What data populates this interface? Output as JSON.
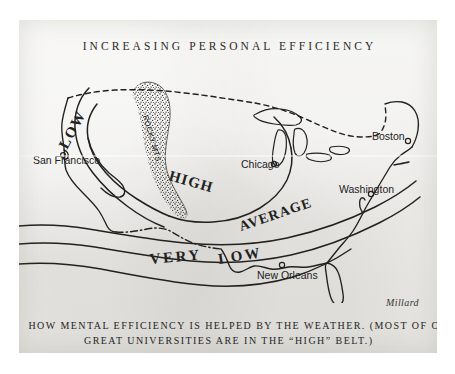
{
  "title": "INCREASING PERSONAL EFFICIENCY",
  "signature": "Millard",
  "caption": {
    "line1": "HOW MENTAL EFFICIENCY IS HELPED BY THE WEATHER.  (MOST OF OUR",
    "line2": "GREAT UNIVERSITIES ARE IN THE “HIGH” BELT.)"
  },
  "map": {
    "cities": [
      {
        "name": "San Francisco",
        "label": "San Francisco"
      },
      {
        "name": "Chicago",
        "label": "Chicago"
      },
      {
        "name": "Boston",
        "label": "Boston"
      },
      {
        "name": "Washington",
        "label": "Washington"
      },
      {
        "name": "New Orleans",
        "label": "New Orleans"
      }
    ],
    "zones": [
      {
        "name": "low-west",
        "label": "LOW"
      },
      {
        "name": "high",
        "label": "HIGH"
      },
      {
        "name": "average",
        "label": "AVERAGE"
      },
      {
        "name": "very",
        "label": "VERY"
      },
      {
        "name": "low-south",
        "label": "LOW"
      }
    ],
    "features": [
      {
        "name": "rocky-mountains",
        "label": "ROCKY MTS."
      }
    ]
  },
  "colors": {
    "paper": "#e9e8e4",
    "ink": "#24231f",
    "scan_margin": "#ffffff"
  }
}
